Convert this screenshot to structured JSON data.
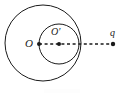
{
  "figure": {
    "kind": "geometry-diagram",
    "background_color": "#ffffff",
    "ink_color": "#1a1a1a",
    "labels": {
      "outer_center": "O",
      "inner_center": "O′",
      "charge": "q"
    },
    "shapes": {
      "outer_circle": {
        "name": "outer-circle",
        "cx": 43,
        "cy": 43,
        "r": 38,
        "stroke": "#1a1a1a",
        "stroke_width": 1,
        "fill": "none"
      },
      "inner_circle": {
        "name": "inner-circle",
        "cx": 59,
        "cy": 44,
        "r": 20,
        "stroke": "#1a1a1a",
        "stroke_width": 1,
        "fill": "none"
      },
      "axis_line": {
        "name": "dashed-axis",
        "x1": 39,
        "y1": 44,
        "x2": 113,
        "y2": 44,
        "stroke": "#1a1a1a",
        "stroke_width": 1.4,
        "dash": "3 2.6"
      },
      "points": [
        {
          "name": "outer-center-dot",
          "label": "O",
          "cx": 39,
          "cy": 44,
          "r": 2.0
        },
        {
          "name": "inner-center-dot",
          "label": "O′",
          "cx": 59,
          "cy": 44,
          "r": 2.0
        },
        {
          "name": "charge-dot",
          "label": "q",
          "cx": 113,
          "cy": 44,
          "r": 2.2
        }
      ]
    }
  }
}
